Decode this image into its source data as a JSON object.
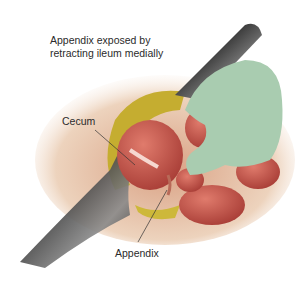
{
  "figure": {
    "caption_line1": "Appendix exposed by",
    "caption_line2": "retracting ileum medially",
    "labels": {
      "cecum": "Cecum",
      "appendix": "Appendix"
    },
    "colors": {
      "background": "#ffffff",
      "skin": "#e8c4a4",
      "fat": "#c9b032",
      "bowel": "#c8534a",
      "glove": "#a9ccb0",
      "retractor": "#3a3a3a",
      "text": "#2b2b2b"
    }
  }
}
